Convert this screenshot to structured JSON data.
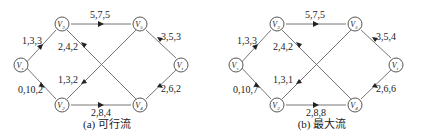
{
  "panels": [
    {
      "id": "a",
      "caption": "(a) 可行流",
      "nodes": {
        "s": {
          "label": "V",
          "sub": "s"
        },
        "v3": {
          "label": "V",
          "sub": "3"
        },
        "v2": {
          "label": "V",
          "sub": "2"
        },
        "v5": {
          "label": "V",
          "sub": "5"
        },
        "v4": {
          "label": "V",
          "sub": "4"
        },
        "t": {
          "label": "V",
          "sub": "t"
        }
      },
      "edges": {
        "s_v3": "1,3,3",
        "s_v2": "0,10,2",
        "v3_v5": "5,7,5",
        "v4_v3": "2,4,2",
        "v5_v2": "1,3,2",
        "v2_v4": "2,8,4",
        "v5_t": "3,5,3",
        "v4_t": "2,6,2"
      }
    },
    {
      "id": "b",
      "caption": "(b) 最大流",
      "nodes": {
        "s": {
          "label": "V",
          "sub": "s"
        },
        "v3": {
          "label": "V",
          "sub": "3"
        },
        "v2": {
          "label": "V",
          "sub": "2"
        },
        "v5": {
          "label": "V",
          "sub": "5"
        },
        "v4": {
          "label": "V",
          "sub": "4"
        },
        "t": {
          "label": "V",
          "sub": "t"
        }
      },
      "edges": {
        "s_v3": "1,3,3",
        "s_v2": "0,10,7",
        "v3_v5": "5,7,5",
        "v4_v3": "2,4,2",
        "v5_v2": "1,3,1",
        "v2_v4": "2,8,8",
        "v5_t": "3,5,4",
        "v4_t": "2,6,6"
      }
    }
  ],
  "colors": {
    "line": "#555555",
    "text": "#222222",
    "node_fill": "#ffffff"
  }
}
